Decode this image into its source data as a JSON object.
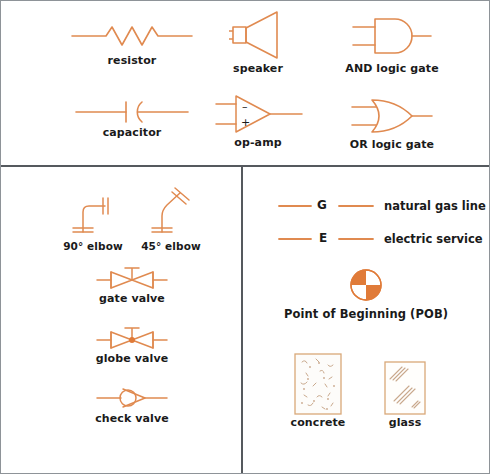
{
  "page": {
    "border_color": "#8e9398",
    "divider_color": "#55595e",
    "symbol_color": "#e08a50",
    "text_color": "#1a1a1a"
  },
  "sections": {
    "electrical": {
      "name": "electrical and electronic symbols",
      "items": [
        {
          "id": "resistor",
          "label": "resistor",
          "icon": "resistor-symbol"
        },
        {
          "id": "speaker",
          "label": "speaker",
          "icon": "speaker-symbol"
        },
        {
          "id": "and_gate",
          "label": "AND logic gate",
          "icon": "and-gate-symbol"
        },
        {
          "id": "capacitor",
          "label": "capacitor",
          "icon": "capacitor-symbol"
        },
        {
          "id": "op_amp",
          "label": "op-amp",
          "icon": "op-amp-symbol"
        },
        {
          "id": "or_gate",
          "label": "OR logic gate",
          "icon": "or-gate-symbol"
        }
      ],
      "op_amp_markings": {
        "inverting": "–",
        "non_inverting": "+"
      }
    },
    "plumbing": {
      "name": "piping and valve symbols",
      "items": [
        {
          "id": "elbow_90",
          "label": "90° elbow",
          "icon": "elbow-90-symbol"
        },
        {
          "id": "elbow_45",
          "label": "45° elbow",
          "icon": "elbow-45-symbol"
        },
        {
          "id": "gate_valve",
          "label": "gate valve",
          "icon": "gate-valve-symbol"
        },
        {
          "id": "globe_valve",
          "label": "globe valve",
          "icon": "globe-valve-symbol"
        },
        {
          "id": "check_valve",
          "label": "check valve",
          "icon": "check-valve-symbol"
        }
      ]
    },
    "site": {
      "name": "site and material symbols",
      "utility_lines": [
        {
          "id": "gas",
          "letter": "G",
          "label": "natural gas line",
          "icon": "utility-line-symbol"
        },
        {
          "id": "electric",
          "letter": "E",
          "label": "electric service",
          "icon": "utility-line-symbol"
        }
      ],
      "point_of_beginning": {
        "id": "pob",
        "label": "Point of Beginning (POB)",
        "icon": "point-of-beginning-symbol",
        "fill_color": "#e07b39"
      },
      "materials": [
        {
          "id": "concrete",
          "label": "concrete",
          "icon": "concrete-hatch-symbol"
        },
        {
          "id": "glass",
          "label": "glass",
          "icon": "glass-hatch-symbol"
        }
      ]
    }
  }
}
